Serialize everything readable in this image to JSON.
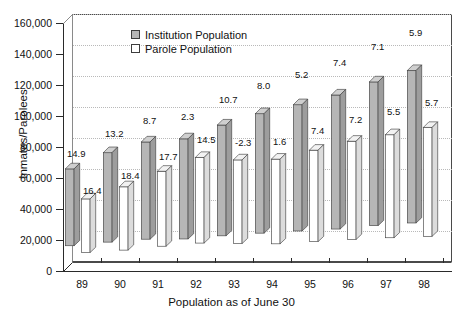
{
  "chart_data": {
    "type": "bar",
    "title": "",
    "xlabel": "Population as of June 30",
    "ylabel": "Inmates/Parolees",
    "categories": [
      "89",
      "90",
      "91",
      "92",
      "93",
      "94",
      "95",
      "96",
      "97",
      "98"
    ],
    "ylim": [
      0,
      160000
    ],
    "yticks": [
      0,
      20000,
      40000,
      60000,
      80000,
      100000,
      120000,
      140000,
      160000
    ],
    "ytick_labels": [
      "0",
      "20,000",
      "40,000",
      "60,000",
      "80,000",
      "100,000",
      "120,000",
      "140,000",
      "160,000"
    ],
    "grid": true,
    "grid_axis": "y",
    "legend_position": "upper-center",
    "series": [
      {
        "name": "Institution Population",
        "color": "#b6b6b6",
        "values": [
          80000,
          93000,
          101000,
          104000,
          115000,
          124000,
          131000,
          139000,
          149000,
          158000
        ],
        "point_labels": [
          "14.9",
          "13.2",
          "8.7",
          "2.3",
          "10.7",
          "8.0",
          "5.2",
          "7.4",
          "7.1",
          "5.9"
        ]
      },
      {
        "name": "Parole Population",
        "color": "#ffffff",
        "values": [
          56000,
          66000,
          78000,
          89000,
          87000,
          88000,
          95000,
          102000,
          107000,
          113000
        ],
        "point_labels": [
          "16.4",
          "18.4",
          "17.7",
          "14.5",
          "-2.3",
          "1.6",
          "7.4",
          "7.2",
          "5.5",
          "5.7"
        ]
      }
    ],
    "label_note": "Data labels are annual percent change values"
  },
  "legend": {
    "items": [
      {
        "label": "Institution Population",
        "swatch": "filled-gray-swatch"
      },
      {
        "label": "Parole Population",
        "swatch": "empty-white-swatch"
      }
    ]
  }
}
